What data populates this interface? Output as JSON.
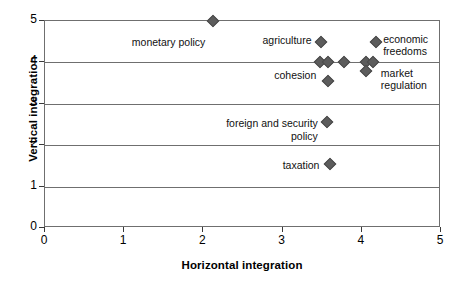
{
  "chart_data": {
    "type": "scatter",
    "title": "",
    "xlabel": "Horizontal integration",
    "ylabel": "Vertical integration",
    "xlim": [
      0,
      5
    ],
    "ylim": [
      0,
      5
    ],
    "xticks": [
      "0",
      "1",
      "2",
      "3",
      "4",
      "5"
    ],
    "yticks": [
      "0",
      "1",
      "2",
      "3",
      "4",
      "5"
    ],
    "grid": "horizontal",
    "legend": "none",
    "marker": "diamond",
    "marker_color": "#5c5c5c",
    "axis_color": "#6f6f6f",
    "points": [
      {
        "label": "monetary policy",
        "x": 2.12,
        "y": 5.0
      },
      {
        "label": "agriculture",
        "x": 3.48,
        "y": 4.49
      },
      {
        "label": "economic freedoms",
        "x": 4.18,
        "y": 4.49
      },
      {
        "label": "",
        "x": 3.47,
        "y": 4.0
      },
      {
        "label": "",
        "x": 3.57,
        "y": 4.0
      },
      {
        "label": "",
        "x": 3.78,
        "y": 4.0
      },
      {
        "label": "",
        "x": 4.05,
        "y": 4.0
      },
      {
        "label": "",
        "x": 4.14,
        "y": 4.0
      },
      {
        "label": "market regulation",
        "x": 4.05,
        "y": 3.8
      },
      {
        "label": "cohesion",
        "x": 3.57,
        "y": 3.55
      },
      {
        "label": "foreign and security policy",
        "x": 3.56,
        "y": 2.55
      },
      {
        "label": "taxation",
        "x": 3.6,
        "y": 1.55
      }
    ],
    "annotations": [
      {
        "text": "monetary policy",
        "x": 2.05,
        "y": 4.63,
        "align": "right"
      },
      {
        "text": "agriculture",
        "x": 3.39,
        "y": 4.69,
        "align": "right"
      },
      {
        "text": "economic\nfreedoms",
        "x": 4.27,
        "y": 4.72,
        "align": "left"
      },
      {
        "text": "cohesion",
        "x": 3.45,
        "y": 3.85,
        "align": "right"
      },
      {
        "text": "market\nregulation",
        "x": 4.24,
        "y": 3.9,
        "align": "left"
      },
      {
        "text": "foreign and security\npolicy",
        "x": 3.47,
        "y": 2.68,
        "align": "right"
      },
      {
        "text": "taxation",
        "x": 3.49,
        "y": 1.66,
        "align": "right"
      }
    ]
  }
}
